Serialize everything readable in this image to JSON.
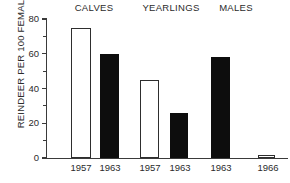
{
  "chart_data": {
    "type": "bar",
    "title": "",
    "xlabel": "",
    "ylabel": "REINDEER PER 100 FEMALES",
    "ylim": [
      0,
      80
    ],
    "ytick_values": [
      0,
      20,
      40,
      60,
      80
    ],
    "ytick_labels": [
      "0",
      "20",
      "40",
      "60",
      "80"
    ],
    "yminor_ticks": [
      10,
      30,
      50,
      70
    ],
    "grid": false,
    "legend": null,
    "groups": [
      {
        "name": "CALVES",
        "bars": [
          {
            "category": "1957",
            "value": 75,
            "style": "open"
          },
          {
            "category": "1963",
            "value": 60,
            "style": "filled"
          }
        ]
      },
      {
        "name": "YEARLINGS",
        "bars": [
          {
            "category": "1957",
            "value": 45,
            "style": "open"
          },
          {
            "category": "1963",
            "value": 26,
            "style": "filled"
          }
        ]
      },
      {
        "name": "MALES",
        "bars": [
          {
            "category": "1963",
            "value": 58,
            "style": "filled"
          },
          {
            "category": "1966",
            "value": 2,
            "style": "open"
          }
        ]
      }
    ],
    "categories": [
      "1957",
      "1963",
      "1957",
      "1963",
      "1963",
      "1966"
    ],
    "values": [
      75,
      60,
      45,
      26,
      58,
      2
    ],
    "colors": {
      "open_bar": "#ffffff",
      "filled_bar": "#0d0d0d",
      "axis": "#3a3a3a",
      "text": "#2b2b2b"
    }
  },
  "layout": {
    "group_label_left": [
      63,
      133,
      207
    ],
    "group_label_width": [
      62,
      76,
      58
    ],
    "bar_left": [
      71,
      100,
      140,
      170,
      211,
      258
    ],
    "bar_width": [
      20,
      19,
      19,
      18,
      19,
      17
    ],
    "xtick_left": [
      57,
      86,
      126,
      156,
      197,
      244
    ],
    "xtick_width": [
      48,
      48,
      48,
      48,
      48,
      48
    ]
  }
}
